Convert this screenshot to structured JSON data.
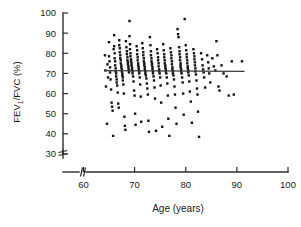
{
  "chart_data": {
    "type": "scatter",
    "title": "",
    "xlabel": "Age (years)",
    "ylabel": "FEV1/FVC (%)",
    "ylabel_parts": {
      "pre": "FEV",
      "sub": "1",
      "post": "/FVC (%)"
    },
    "xlim": [
      56,
      100
    ],
    "ylim": [
      28,
      100
    ],
    "xticks": [
      60,
      70,
      80,
      90,
      100
    ],
    "yticks": [
      30,
      40,
      50,
      60,
      70,
      80,
      90,
      100
    ],
    "xtick_labels": [
      "60",
      "70",
      "80",
      "90",
      "100"
    ],
    "ytick_labels": [
      "30",
      "40",
      "50",
      "60",
      "70",
      "80",
      "90",
      "100"
    ],
    "grid": false,
    "legend": null,
    "axis_break_x": true,
    "axis_break_y": true,
    "trend_line": {
      "kind": "linear-fit",
      "x_start": 64.0,
      "x_end": 91.5,
      "y_start": 71.4,
      "y_end": 71.0,
      "slope": -0.0145,
      "intercept": 72.3
    },
    "marker": {
      "shape": "square",
      "size_px": 2.4,
      "color": "#111111"
    },
    "n_points": 249,
    "points": [
      [
        64.2,
        79.0
      ],
      [
        64.3,
        71.5
      ],
      [
        64.4,
        63.5
      ],
      [
        64.6,
        45.0
      ],
      [
        64.7,
        74.5
      ],
      [
        64.8,
        68.0
      ],
      [
        65.0,
        85.5
      ],
      [
        65.0,
        78.5
      ],
      [
        65.1,
        76.0
      ],
      [
        65.2,
        73.0
      ],
      [
        65.2,
        70.5
      ],
      [
        65.3,
        67.0
      ],
      [
        65.4,
        62.0
      ],
      [
        65.5,
        55.5
      ],
      [
        65.6,
        53.5
      ],
      [
        65.7,
        51.5
      ],
      [
        65.8,
        39.0
      ],
      [
        65.9,
        82.0
      ],
      [
        66.0,
        89.0
      ],
      [
        66.0,
        83.5
      ],
      [
        66.1,
        80.0
      ],
      [
        66.1,
        77.5
      ],
      [
        66.2,
        76.0
      ],
      [
        66.2,
        74.0
      ],
      [
        66.3,
        72.5
      ],
      [
        66.3,
        71.0
      ],
      [
        66.4,
        70.0
      ],
      [
        66.4,
        68.5
      ],
      [
        66.5,
        67.0
      ],
      [
        66.5,
        65.5
      ],
      [
        66.6,
        64.0
      ],
      [
        66.7,
        60.5
      ],
      [
        66.8,
        55.0
      ],
      [
        66.9,
        53.0
      ],
      [
        67.0,
        86.5
      ],
      [
        67.0,
        84.0
      ],
      [
        67.1,
        82.5
      ],
      [
        67.1,
        80.5
      ],
      [
        67.2,
        79.0
      ],
      [
        67.2,
        77.5
      ],
      [
        67.3,
        76.5
      ],
      [
        67.3,
        75.0
      ],
      [
        67.4,
        74.0
      ],
      [
        67.4,
        73.0
      ],
      [
        67.5,
        72.0
      ],
      [
        67.5,
        71.0
      ],
      [
        67.6,
        70.0
      ],
      [
        67.6,
        69.0
      ],
      [
        67.7,
        68.0
      ],
      [
        67.7,
        66.5
      ],
      [
        67.8,
        64.5
      ],
      [
        67.9,
        60.0
      ],
      [
        68.0,
        48.5
      ],
      [
        68.1,
        44.0
      ],
      [
        68.2,
        42.0
      ],
      [
        68.3,
        86.0
      ],
      [
        68.4,
        83.0
      ],
      [
        68.5,
        81.0
      ],
      [
        68.5,
        79.5
      ],
      [
        68.6,
        78.0
      ],
      [
        68.6,
        76.5
      ],
      [
        68.7,
        75.5
      ],
      [
        68.7,
        74.5
      ],
      [
        68.8,
        73.5
      ],
      [
        68.8,
        72.5
      ],
      [
        68.9,
        71.5
      ],
      [
        68.9,
        70.5
      ],
      [
        69.0,
        96.0
      ],
      [
        69.0,
        88.5
      ],
      [
        69.1,
        84.5
      ],
      [
        69.1,
        82.0
      ],
      [
        69.2,
        80.0
      ],
      [
        69.2,
        78.5
      ],
      [
        69.3,
        77.0
      ],
      [
        69.3,
        76.0
      ],
      [
        69.4,
        75.0
      ],
      [
        69.4,
        74.0
      ],
      [
        69.5,
        73.0
      ],
      [
        69.5,
        72.0
      ],
      [
        69.6,
        71.0
      ],
      [
        69.6,
        70.0
      ],
      [
        69.7,
        68.5
      ],
      [
        69.8,
        66.0
      ],
      [
        69.9,
        61.5
      ],
      [
        70.0,
        59.0
      ],
      [
        70.1,
        50.0
      ],
      [
        70.2,
        44.5
      ],
      [
        70.4,
        83.5
      ],
      [
        70.5,
        81.5
      ],
      [
        70.5,
        79.5
      ],
      [
        70.6,
        78.0
      ],
      [
        70.6,
        76.5
      ],
      [
        70.7,
        75.0
      ],
      [
        70.7,
        74.0
      ],
      [
        70.8,
        73.0
      ],
      [
        70.8,
        72.0
      ],
      [
        70.9,
        71.0
      ],
      [
        70.9,
        70.0
      ],
      [
        71.0,
        68.0
      ],
      [
        71.1,
        64.5
      ],
      [
        71.2,
        58.5
      ],
      [
        71.3,
        46.0
      ],
      [
        71.5,
        85.0
      ],
      [
        71.6,
        82.5
      ],
      [
        71.7,
        80.5
      ],
      [
        71.7,
        79.0
      ],
      [
        71.8,
        77.5
      ],
      [
        71.8,
        76.0
      ],
      [
        71.9,
        75.0
      ],
      [
        71.9,
        74.0
      ],
      [
        72.0,
        73.0
      ],
      [
        72.0,
        72.0
      ],
      [
        72.1,
        71.0
      ],
      [
        72.1,
        70.0
      ],
      [
        72.2,
        69.0
      ],
      [
        72.3,
        67.5
      ],
      [
        72.4,
        65.0
      ],
      [
        72.5,
        62.5
      ],
      [
        72.6,
        59.5
      ],
      [
        72.7,
        46.5
      ],
      [
        72.8,
        41.0
      ],
      [
        73.0,
        88.0
      ],
      [
        73.1,
        84.0
      ],
      [
        73.2,
        81.0
      ],
      [
        73.2,
        79.0
      ],
      [
        73.3,
        77.5
      ],
      [
        73.3,
        76.0
      ],
      [
        73.4,
        75.0
      ],
      [
        73.4,
        74.0
      ],
      [
        73.5,
        73.0
      ],
      [
        73.5,
        72.0
      ],
      [
        73.6,
        71.0
      ],
      [
        73.6,
        70.0
      ],
      [
        73.7,
        68.5
      ],
      [
        73.8,
        66.5
      ],
      [
        73.9,
        63.0
      ],
      [
        74.0,
        57.5
      ],
      [
        74.2,
        41.5
      ],
      [
        74.4,
        82.0
      ],
      [
        74.5,
        80.0
      ],
      [
        74.6,
        78.0
      ],
      [
        74.6,
        76.5
      ],
      [
        74.7,
        75.0
      ],
      [
        74.7,
        73.5
      ],
      [
        74.8,
        72.0
      ],
      [
        74.8,
        71.0
      ],
      [
        74.9,
        70.0
      ],
      [
        75.0,
        68.0
      ],
      [
        75.1,
        64.0
      ],
      [
        75.2,
        55.5
      ],
      [
        75.4,
        43.5
      ],
      [
        75.6,
        84.5
      ],
      [
        75.7,
        81.5
      ],
      [
        75.8,
        79.5
      ],
      [
        75.8,
        78.0
      ],
      [
        75.9,
        76.5
      ],
      [
        75.9,
        75.0
      ],
      [
        76.0,
        74.0
      ],
      [
        76.0,
        73.0
      ],
      [
        76.1,
        72.0
      ],
      [
        76.1,
        71.0
      ],
      [
        76.2,
        70.0
      ],
      [
        76.3,
        68.0
      ],
      [
        76.4,
        65.0
      ],
      [
        76.5,
        59.0
      ],
      [
        76.6,
        47.5
      ],
      [
        76.8,
        39.0
      ],
      [
        77.0,
        82.5
      ],
      [
        77.1,
        80.5
      ],
      [
        77.2,
        79.0
      ],
      [
        77.2,
        77.5
      ],
      [
        77.3,
        76.0
      ],
      [
        77.3,
        74.5
      ],
      [
        77.4,
        73.0
      ],
      [
        77.4,
        72.0
      ],
      [
        77.5,
        71.0
      ],
      [
        77.5,
        70.0
      ],
      [
        77.6,
        69.0
      ],
      [
        77.7,
        67.0
      ],
      [
        77.8,
        63.5
      ],
      [
        77.9,
        59.5
      ],
      [
        78.0,
        53.0
      ],
      [
        78.2,
        45.0
      ],
      [
        78.4,
        92.0
      ],
      [
        78.5,
        89.5
      ],
      [
        78.6,
        88.0
      ],
      [
        78.7,
        83.0
      ],
      [
        78.8,
        81.0
      ],
      [
        78.8,
        79.5
      ],
      [
        78.9,
        78.0
      ],
      [
        78.9,
        76.5
      ],
      [
        79.0,
        75.0
      ],
      [
        79.0,
        74.0
      ],
      [
        79.0,
        73.0
      ],
      [
        79.1,
        72.0
      ],
      [
        79.1,
        71.0
      ],
      [
        79.2,
        70.0
      ],
      [
        79.3,
        68.0
      ],
      [
        79.4,
        65.5
      ],
      [
        79.5,
        60.0
      ],
      [
        79.6,
        49.5
      ],
      [
        79.8,
        97.0
      ],
      [
        80.0,
        84.0
      ],
      [
        80.1,
        81.5
      ],
      [
        80.2,
        79.5
      ],
      [
        80.2,
        78.0
      ],
      [
        80.3,
        76.5
      ],
      [
        80.3,
        75.0
      ],
      [
        80.4,
        73.5
      ],
      [
        80.4,
        72.5
      ],
      [
        80.5,
        71.5
      ],
      [
        80.5,
        70.5
      ],
      [
        80.6,
        69.0
      ],
      [
        80.7,
        66.0
      ],
      [
        80.8,
        61.0
      ],
      [
        81.0,
        56.0
      ],
      [
        81.2,
        45.5
      ],
      [
        81.5,
        82.0
      ],
      [
        81.6,
        80.0
      ],
      [
        81.7,
        78.5
      ],
      [
        81.7,
        77.0
      ],
      [
        81.8,
        75.5
      ],
      [
        81.8,
        74.0
      ],
      [
        81.9,
        72.5
      ],
      [
        81.9,
        71.0
      ],
      [
        82.0,
        69.5
      ],
      [
        82.1,
        66.5
      ],
      [
        82.2,
        62.5
      ],
      [
        82.3,
        59.5
      ],
      [
        82.4,
        51.0
      ],
      [
        82.6,
        38.5
      ],
      [
        83.0,
        80.0
      ],
      [
        83.2,
        77.0
      ],
      [
        83.3,
        74.0
      ],
      [
        83.4,
        72.0
      ],
      [
        83.5,
        70.5
      ],
      [
        83.6,
        68.0
      ],
      [
        83.8,
        63.0
      ],
      [
        84.2,
        79.0
      ],
      [
        84.4,
        75.5
      ],
      [
        84.5,
        72.5
      ],
      [
        84.6,
        70.0
      ],
      [
        84.8,
        65.5
      ],
      [
        85.2,
        77.5
      ],
      [
        85.5,
        73.5
      ],
      [
        85.8,
        71.5
      ],
      [
        86.0,
        86.0
      ],
      [
        86.2,
        79.0
      ],
      [
        86.4,
        63.5
      ],
      [
        86.6,
        61.5
      ],
      [
        87.0,
        74.0
      ],
      [
        87.4,
        70.0
      ],
      [
        88.0,
        68.5
      ],
      [
        88.4,
        59.0
      ],
      [
        89.0,
        76.0
      ],
      [
        89.4,
        59.5
      ],
      [
        91.0,
        76.0
      ]
    ]
  },
  "axes_geometry": {
    "x_axis_px": {
      "left": 63,
      "right": 288,
      "y": 172
    },
    "y_axis_px": {
      "x": 63,
      "top": 13,
      "bottom": 158
    },
    "note_y_break_px": 150,
    "note_x_break_px": 84
  }
}
